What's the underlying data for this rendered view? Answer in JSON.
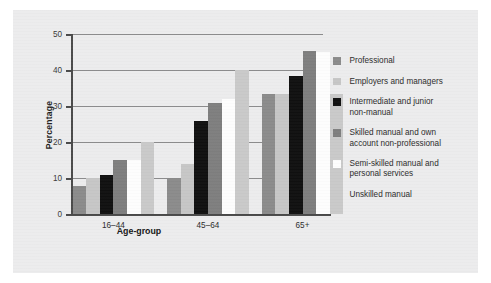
{
  "figure": {
    "background_color": "#ececed"
  },
  "chart_data": {
    "type": "bar",
    "title": "",
    "xlabel": "Age-group",
    "ylabel": "Percentage",
    "categories": [
      "16–44",
      "45–64",
      "65+"
    ],
    "ylim": [
      0,
      50
    ],
    "yticks": [
      0,
      10,
      20,
      30,
      40,
      50
    ],
    "ytick_labels": [
      "0",
      "10",
      "20",
      "30",
      "40",
      "50"
    ],
    "grid": true,
    "grid_axis": "y",
    "legend_position": "right",
    "series": [
      {
        "name": "Professional",
        "color": "#8b8b8b",
        "values": [
          8,
          10,
          33.5
        ]
      },
      {
        "name": "Employers and managers",
        "color": "#c6c6c6",
        "values": [
          10,
          14,
          33.5
        ]
      },
      {
        "name": "Intermediate and junior non-manual",
        "color": "#101010",
        "values": [
          11,
          26,
          38.5
        ]
      },
      {
        "name": "Skilled manual and own account non-professional",
        "color": "#7e7e7e",
        "values": [
          15,
          31,
          45.5
        ]
      },
      {
        "name": "Semi-skilled manual and personal services",
        "color": "#fdfdfd",
        "values": [
          15,
          32,
          45
        ]
      },
      {
        "name": "Unskilled manual",
        "color": "#c9c9c9",
        "values": [
          20,
          40,
          33.5
        ]
      }
    ]
  },
  "legend": {
    "items": [
      {
        "label": "Professional",
        "color": "#8b8b8b"
      },
      {
        "label": "Employers and managers",
        "color": "#c6c6c6"
      },
      {
        "label": "Intermediate and junior\nnon-manual",
        "color": "#101010"
      },
      {
        "label": "Skilled manual and own\naccount non-professional",
        "color": "#7e7e7e"
      },
      {
        "label": "Semi-skilled manual and\npersonal services",
        "color": "#fdfdfd"
      },
      {
        "label": "Unskilled manual",
        "color": "#c9c9c9"
      }
    ]
  }
}
